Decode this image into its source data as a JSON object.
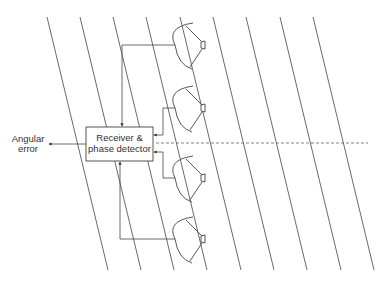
{
  "diagram": {
    "type": "monopulse phase-comparison tracking antenna block diagram",
    "colors": {
      "line": "#444444",
      "text": "#333333",
      "background": "#ffffff"
    },
    "wavefronts": {
      "count": 9,
      "top_y": 17,
      "bottom_y": 270,
      "top_x": [
        47,
        80,
        113,
        146,
        180,
        213,
        246,
        280,
        313
      ],
      "slant_dx": 61
    },
    "antennas": [
      {
        "id": "antenna-1",
        "center_y": 45
      },
      {
        "id": "antenna-2",
        "center_y": 108
      },
      {
        "id": "antenna-3",
        "center_y": 178
      },
      {
        "id": "antenna-4",
        "center_y": 239
      }
    ],
    "receiver_box": {
      "line1": "Receiver &",
      "line2": "phase detector"
    },
    "output": {
      "line1": "Angular",
      "line2": "error"
    },
    "boresight": {
      "style": "dashed",
      "y": 143
    }
  }
}
